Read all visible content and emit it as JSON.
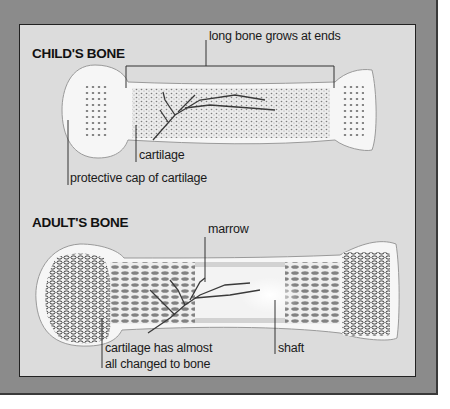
{
  "colors": {
    "frame": "#8b8b8b",
    "panel": "#dcdcdc",
    "bone": "#f4f4f4",
    "ink": "#1a1a1a"
  },
  "child": {
    "title": "CHILD'S BONE",
    "labels": {
      "growth": "long bone grows at ends",
      "cartilage": "cartilage",
      "cap": "protective cap of cartilage"
    }
  },
  "adult": {
    "title": "ADULT'S BONE",
    "labels": {
      "marrow": "marrow",
      "changed_line1": "cartilage has almost",
      "changed_line2": "all changed to bone",
      "shaft": "shaft"
    }
  }
}
